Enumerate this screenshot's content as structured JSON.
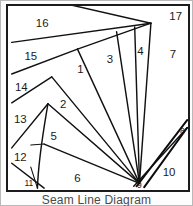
{
  "figure": {
    "caption": "Seam Line Diagram",
    "frame_color": "#1b1b1b",
    "line_color": "#111111",
    "background_color": "#ffffff",
    "label_color": "#1a1a1a"
  },
  "diagram": {
    "type": "seam-line-piecing-diagram",
    "piece_count": 17,
    "pieces": [
      {
        "id": "1",
        "label": "1",
        "x": 78,
        "y": 69,
        "size": "normal"
      },
      {
        "id": "2",
        "label": "2",
        "x": 60,
        "y": 105,
        "size": "normal"
      },
      {
        "id": "3",
        "label": "3",
        "x": 109,
        "y": 58,
        "size": "normal"
      },
      {
        "id": "4",
        "label": "4",
        "x": 141,
        "y": 50,
        "size": "normal"
      },
      {
        "id": "5",
        "label": "5",
        "x": 50,
        "y": 139,
        "size": "normal"
      },
      {
        "id": "6",
        "label": "6",
        "x": 75,
        "y": 182,
        "size": "normal"
      },
      {
        "id": "7",
        "label": "7",
        "x": 175,
        "y": 53,
        "size": "normal"
      },
      {
        "id": "8",
        "label": "8",
        "x": 185,
        "y": 133,
        "size": "small"
      },
      {
        "id": "9",
        "label": "9",
        "x": 140,
        "y": 189,
        "size": "small"
      },
      {
        "id": "10",
        "label": "10",
        "x": 171,
        "y": 176,
        "size": "normal"
      },
      {
        "id": "11",
        "label": "11",
        "x": 24,
        "y": 187,
        "size": "small"
      },
      {
        "id": "12",
        "label": "12",
        "x": 15,
        "y": 160,
        "size": "normal"
      },
      {
        "id": "13",
        "label": "13",
        "x": 15,
        "y": 121,
        "size": "normal"
      },
      {
        "id": "14",
        "label": "14",
        "x": 16,
        "y": 88,
        "size": "normal"
      },
      {
        "id": "15",
        "label": "15",
        "x": 26,
        "y": 55,
        "size": "normal"
      },
      {
        "id": "16",
        "label": "16",
        "x": 38,
        "y": 21,
        "size": "normal"
      },
      {
        "id": "17",
        "label": "17",
        "x": 178,
        "y": 14,
        "size": "normal"
      }
    ],
    "seam_paths": [
      {
        "name": "seam-top-16",
        "d": "M 68 1 L 152 20"
      },
      {
        "name": "seam-16-15",
        "d": "M 6 40 L 152 20"
      },
      {
        "name": "seam-15-14",
        "d": "M 6 73 L 75 47"
      },
      {
        "name": "seam-14-13",
        "d": "M 6 103 L 48 76"
      },
      {
        "name": "seam-13-12",
        "d": "M 6 150 L 44 104"
      },
      {
        "name": "seam-12-11",
        "d": "M 6 166 L 40 192"
      },
      {
        "name": "seam-11-right",
        "d": "M 26 170 L 33 192"
      },
      {
        "name": "seam-fan-1",
        "d": "M 75 47 L 152 20"
      },
      {
        "name": "seam-fan-2",
        "d": "M 75 47 L 140 187"
      },
      {
        "name": "seam-fan-3",
        "d": "M 48 76 L 140 187"
      },
      {
        "name": "seam-fan-4",
        "d": "M 44 104 L 140 187"
      },
      {
        "name": "seam-fan-5",
        "d": "M 40 146 L 140 187"
      },
      {
        "name": "seam-fan-6",
        "d": "M 152 20 L 140 187"
      },
      {
        "name": "seam-fan-7",
        "d": "M 116 29 L 140 187"
      },
      {
        "name": "seam-fan-8",
        "d": "M 135 24 L 140 187"
      },
      {
        "name": "seam-left-curve",
        "d": "M 44 104 C 40 128 34 160 33 192"
      },
      {
        "name": "seam-left-tick-12",
        "d": "M 26 147 L 40 146"
      },
      {
        "name": "seam-band-outer",
        "d": "M 190 121 L 137 190"
      },
      {
        "name": "seam-band-inner",
        "d": "M 190 129 L 134 190"
      },
      {
        "name": "seam-10-right",
        "d": "M 190 129 L 145 191"
      }
    ]
  }
}
